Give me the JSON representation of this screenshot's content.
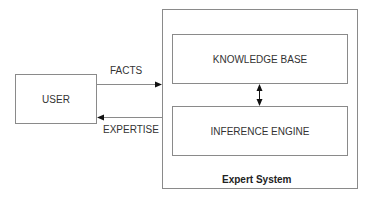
{
  "diagram": {
    "user_box": {
      "label": "USER"
    },
    "expert_system": {
      "label": "Expert System",
      "knowledge_base": {
        "label": "KNOWLEDGE BASE"
      },
      "inference_engine": {
        "label": "INFERENCE ENGINE"
      }
    },
    "arrows": {
      "facts": {
        "label": "FACTS",
        "from": "USER",
        "to": "Expert System"
      },
      "expertise": {
        "label": "EXPERTISE",
        "from": "Expert System",
        "to": "USER"
      },
      "kb_ie": {
        "label": "",
        "from": "KNOWLEDGE BASE",
        "to": "INFERENCE ENGINE",
        "bidirectional": true
      }
    },
    "colors": {
      "line": "#8a8a8a",
      "arrowhead": "#111111",
      "text": "#333333"
    }
  }
}
